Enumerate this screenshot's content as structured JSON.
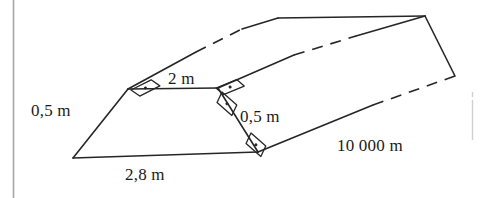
{
  "figure": {
    "kind": "trapezoidal-prism",
    "stroke_color": "#262626",
    "page_border_color": "#a8a8a8",
    "background_color": "#ffffff"
  },
  "labels": {
    "top_width": "2 m",
    "left_slant_height": "0,5 m",
    "right_slant_height": "0,5 m",
    "bottom_width": "2,8 m",
    "length": "10 000 m"
  },
  "angle_marks": [
    {
      "name": "right-angle-top-left",
      "x": 131,
      "y": 90,
      "rotation": -14
    },
    {
      "name": "right-angle-top-right-upper",
      "x": 222,
      "y": 90,
      "rotation": -14
    },
    {
      "name": "right-angle-top-right-lower",
      "x": 233,
      "y": 101,
      "rotation": 52
    },
    {
      "name": "right-angle-bottom-right",
      "x": 262,
      "y": 146,
      "rotation": 52
    }
  ],
  "geometry": {
    "near_face": {
      "bottom_left": [
        73,
        158
      ],
      "top_left": [
        128,
        89
      ],
      "top_right": [
        218,
        88
      ],
      "bottom_right": [
        258,
        152
      ]
    },
    "far_face": {
      "top_left": [
        278,
        18
      ],
      "top_right": [
        425,
        16
      ],
      "bottom_right": [
        455,
        76
      ],
      "bottom_left": [
        312,
        78
      ]
    }
  }
}
